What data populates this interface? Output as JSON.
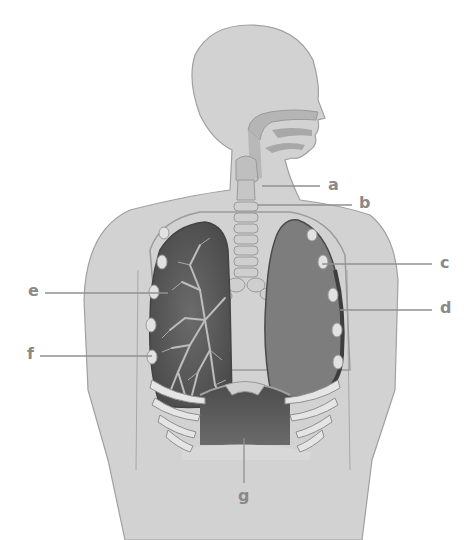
{
  "diagram": {
    "colors": {
      "body_fill": "#d2d2d2",
      "body_stroke": "#a0a0a0",
      "airway_fill": "#bdbdbd",
      "airway_dark": "#a5a5a5",
      "lung_dark": "#5a5a5a",
      "lung_right_fill": "#7d7d7d",
      "rib_fill": "#e6e6e6",
      "diaphragm": "#555555",
      "label_text": "#8a8a8a",
      "leader_line": "#909090"
    },
    "labels": [
      {
        "id": "a",
        "text": "a"
      },
      {
        "id": "b",
        "text": "b"
      },
      {
        "id": "c",
        "text": "c"
      },
      {
        "id": "d",
        "text": "d"
      },
      {
        "id": "e",
        "text": "e"
      },
      {
        "id": "f",
        "text": "f"
      },
      {
        "id": "g",
        "text": "g"
      }
    ]
  }
}
